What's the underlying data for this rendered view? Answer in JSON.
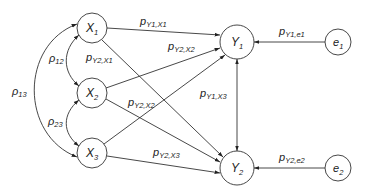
{
  "diagram": {
    "type": "path-diagram",
    "nodes": [
      {
        "id": "X1",
        "main": "X",
        "sub": "1",
        "cx": 92,
        "cy": 28,
        "r": 15
      },
      {
        "id": "X2",
        "main": "X",
        "sub": "2",
        "cx": 92,
        "cy": 93,
        "r": 15
      },
      {
        "id": "X3",
        "main": "X",
        "sub": "3",
        "cx": 92,
        "cy": 153,
        "r": 15
      },
      {
        "id": "Y1",
        "main": "Y",
        "sub": "1",
        "cx": 237,
        "cy": 42,
        "r": 17
      },
      {
        "id": "Y2",
        "main": "Y",
        "sub": "2",
        "cx": 237,
        "cy": 168,
        "r": 17
      },
      {
        "id": "e1",
        "main": "e",
        "sub": "1",
        "cx": 338,
        "cy": 42,
        "r": 13
      },
      {
        "id": "e2",
        "main": "e",
        "sub": "2",
        "cx": 338,
        "cy": 168,
        "r": 13
      }
    ],
    "correlations": [
      {
        "id": "rho12",
        "from": "X1",
        "to": "X2",
        "main": "ρ",
        "sub": "12"
      },
      {
        "id": "rho23",
        "from": "X2",
        "to": "X3",
        "main": "ρ",
        "sub": "23"
      },
      {
        "id": "rho13",
        "from": "X1",
        "to": "X3",
        "main": "ρ",
        "sub": "13"
      }
    ],
    "paths": [
      {
        "id": "pY1X1",
        "from": "X1",
        "to": "Y1",
        "main": "p",
        "sub": "Y1,X1"
      },
      {
        "id": "pY2X1",
        "from": "X1",
        "to": "Y2",
        "main": "p",
        "sub": "Y2,X1"
      },
      {
        "id": "pY1X2",
        "from": "X2",
        "to": "Y1",
        "main": "p",
        "sub": "Y2,X2"
      },
      {
        "id": "pY2X2",
        "from": "X2",
        "to": "Y2",
        "main": "p",
        "sub": "Y2,X2"
      },
      {
        "id": "pY1X3",
        "from": "X3",
        "to": "Y1",
        "main": "p",
        "sub": "Y1,X3"
      },
      {
        "id": "pY2X3",
        "from": "X3",
        "to": "Y2",
        "main": "p",
        "sub": "Y2,X3"
      },
      {
        "id": "pY1e1",
        "from": "e1",
        "to": "Y1",
        "main": "p",
        "sub": "Y1,e1"
      },
      {
        "id": "pY2e2",
        "from": "e2",
        "to": "Y2",
        "main": "p",
        "sub": "Y2,e2"
      }
    ],
    "y_covariance": {
      "from": "Y1",
      "to": "Y2",
      "bidirectional": true
    }
  }
}
